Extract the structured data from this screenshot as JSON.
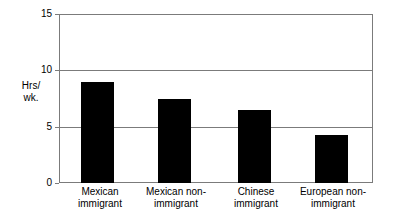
{
  "chart_data": {
    "type": "bar",
    "title": "",
    "xlabel": "",
    "ylabel": "Hrs/ wk.",
    "ylabel_lines": [
      "Hrs/",
      "wk."
    ],
    "categories": [
      "Mexican immigrant",
      "Mexican non-immigrant",
      "Chinese immigrant",
      "European non-immigrant"
    ],
    "category_lines": [
      [
        "Mexican",
        "immigrant"
      ],
      [
        "Mexican non-",
        "immigrant"
      ],
      [
        "Chinese",
        "immigrant"
      ],
      [
        "European non-",
        "immigrant"
      ]
    ],
    "values": [
      9.0,
      7.5,
      6.5,
      4.3
    ],
    "ylim": [
      0,
      15
    ],
    "yticks": [
      0,
      5,
      10,
      15
    ],
    "ytick_labels": [
      "0",
      "5",
      "10",
      "15"
    ],
    "grid": true,
    "grid_axis": "y",
    "legend": "none",
    "bar_color": "#000000",
    "grid_color": "#7b7b7b",
    "background_color": "#ffffff",
    "text_color": "#000000"
  }
}
